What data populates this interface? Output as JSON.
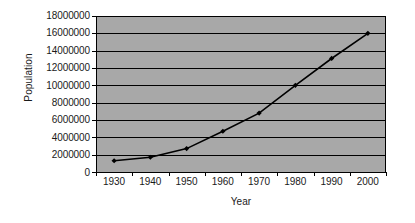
{
  "chart_data": {
    "type": "line",
    "title": "",
    "xlabel": "Year",
    "ylabel": "Population",
    "categories": [
      "1930",
      "1940",
      "1950",
      "1960",
      "1970",
      "1980",
      "1990",
      "2000"
    ],
    "x": [
      1930,
      1940,
      1950,
      1960,
      1970,
      1980,
      1990,
      2000
    ],
    "values": [
      1300000,
      1700000,
      2700000,
      4700000,
      6800000,
      10000000,
      13100000,
      16000000
    ],
    "series": [
      {
        "name": "Population",
        "values": [
          1300000,
          1700000,
          2700000,
          4700000,
          6800000,
          10000000,
          13100000,
          16000000
        ],
        "marker": "diamond",
        "color": "#000000"
      }
    ],
    "ylim": [
      0,
      18000000
    ],
    "ytick_step": 2000000,
    "ytick_labels": [
      "18000000",
      "16000000",
      "14000000",
      "12000000",
      "10000000",
      "8000000",
      "6000000",
      "4000000",
      "2000000",
      "0"
    ],
    "xtick_labels": [
      "1930",
      "1940",
      "1950",
      "1960",
      "1970",
      "1980",
      "1990",
      "2000"
    ],
    "grid": "horizontal",
    "legend": "none",
    "plot_area_color": "#a8a8a8",
    "gridline_color": "#000000",
    "axis_color": "#000000",
    "background_color": "#ffffff"
  }
}
